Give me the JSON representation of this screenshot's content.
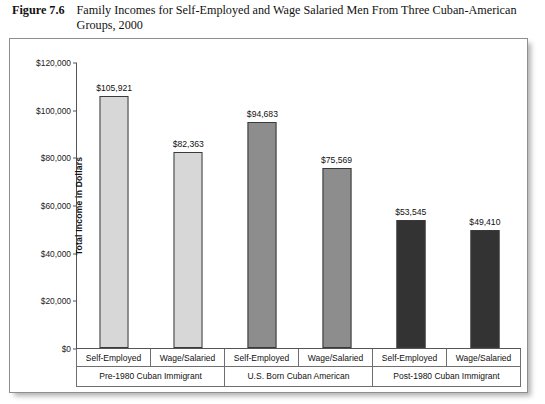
{
  "figure": {
    "number": "Figure 7.6",
    "title": "Family Incomes for Self-Employed and Wage Salaried Men From Three Cuban-American Groups, 2000"
  },
  "chart_data": {
    "type": "bar",
    "title": "Family Incomes for Self-Employed and Wage Salaried Men From Three Cuban-American Groups, 2000",
    "xlabel": "",
    "ylabel": "Total Income in Dollars",
    "ylim": [
      0,
      120000
    ],
    "ytick_step": 20000,
    "ytick_labels": [
      "$0",
      "$20,000",
      "$40,000",
      "$60,000",
      "$80,000",
      "$100,000",
      "$120,000"
    ],
    "ytick_values": [
      0,
      20000,
      40000,
      60000,
      80000,
      100000,
      120000
    ],
    "grid": false,
    "legend": "none",
    "categories": [
      "Self-Employed",
      "Wage/Salaried",
      "Self-Employed",
      "Wage/Salaried",
      "Self-Employed",
      "Wage/Salaried"
    ],
    "values": [
      105921,
      82363,
      94683,
      75569,
      53545,
      49410
    ],
    "value_labels": [
      "$105,921",
      "$82,363",
      "$94,683",
      "$75,569",
      "$53,545",
      "$49,410"
    ],
    "bar_colors": [
      "#d7d7d7",
      "#d7d7d7",
      "#8d8d8d",
      "#8d8d8d",
      "#333333",
      "#333333"
    ],
    "groups": [
      {
        "label": "Pre-1980 Cuban Immigrant",
        "span": 2,
        "color": "#d7d7d7"
      },
      {
        "label": "U.S. Born Cuban American",
        "span": 2,
        "color": "#8d8d8d"
      },
      {
        "label": "Post-1980 Cuban Immigrant",
        "span": 2,
        "color": "#333333"
      }
    ]
  },
  "style": {
    "bar_border": "#3a3a3a",
    "axis_color": "#555555",
    "frame_color": "#8e8e8e",
    "table_border": "#6f6f6f"
  }
}
